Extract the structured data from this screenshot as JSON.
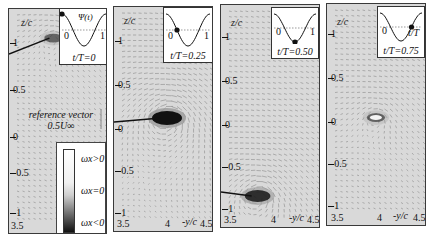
{
  "figure": {
    "type": "PIV velocity vector field with spanwise vorticity contours",
    "panels": [
      {
        "id": "p1",
        "phase_label": "t/T=0",
        "inset_curve_label": "Ψ(t)",
        "inset_x_ticks": [
          "0",
          "1"
        ],
        "marker_phase": 0.0,
        "y_axis_label": "z/c",
        "y_ticks": [
          "1",
          "0.5",
          "0",
          "-0.5",
          "-1"
        ],
        "x_axis_label": "-y/c",
        "x_ticks": [
          "3.5",
          "4",
          "4.5"
        ],
        "vortex": {
          "y_over_c": 3.9,
          "z_over_c": 1.0,
          "strength": "weak"
        }
      },
      {
        "id": "p2",
        "phase_label": "t/T=0.25",
        "inset_x_ticks": [
          "0",
          "1"
        ],
        "marker_phase": 0.25,
        "y_axis_label": "z/c",
        "y_ticks": [
          "1",
          "0.5",
          "0",
          "-0.5",
          "-1"
        ],
        "x_axis_label": "-y/c",
        "x_ticks": [
          "3.5",
          "4",
          "4.5"
        ],
        "vortex": {
          "y_over_c": 4.0,
          "z_over_c": 0.0,
          "strength": "strong"
        }
      },
      {
        "id": "p3",
        "phase_label": "t/T=0.50",
        "inset_x_ticks": [
          "0",
          "1"
        ],
        "marker_phase": 0.5,
        "y_axis_label": "z/c",
        "y_ticks": [
          "1",
          "0.5",
          "0",
          "-0.5",
          "-1"
        ],
        "x_axis_label": "-y/c",
        "x_ticks": [
          "3.5",
          "4",
          "4.5"
        ],
        "vortex": {
          "y_over_c": 3.8,
          "z_over_c": -1.0,
          "strength": "moderate"
        }
      },
      {
        "id": "p4",
        "phase_label": "t/T=0.75",
        "inset_x_ticks": [
          "0",
          "t/T"
        ],
        "marker_phase": 0.75,
        "y_axis_label": "z/c",
        "y_ticks": [
          "1",
          "0.5",
          "0",
          "-0.5",
          "-1"
        ],
        "x_axis_label": "-y/c",
        "x_ticks": [
          "3.5",
          "4",
          "4.5"
        ],
        "vortex": {
          "y_over_c": 3.95,
          "z_over_c": -0.05,
          "strength": "weak"
        }
      }
    ],
    "reference_vector": {
      "line1": "reference vector",
      "line2": "0.5U∞"
    },
    "legend": {
      "items": [
        "ωx>0",
        "ωx=0",
        "ωx<0"
      ]
    },
    "colors": {
      "background": "#d9d9d9",
      "vector": "#7a7a7a",
      "vortex_core": "#111111",
      "frame": "#3a3a3a"
    }
  }
}
